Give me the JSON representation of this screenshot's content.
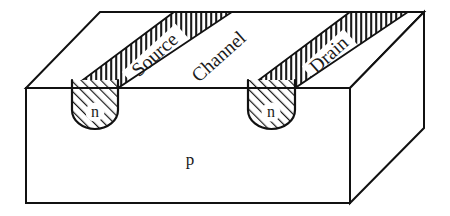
{
  "figure": {
    "background_color": "#ffffff",
    "line_color": "#111111",
    "hatch_color": "#1a1a1a",
    "width": 450,
    "height": 216
  },
  "labels": {
    "source": "Source",
    "channel": "Channel",
    "drain": "Drain",
    "n_left": "n",
    "n_right": "n",
    "substrate": "p"
  },
  "regions": [
    {
      "name": "source-stripe",
      "label": "Source",
      "fill": "hatched-vertical",
      "face": "top"
    },
    {
      "name": "channel-region",
      "label": "Channel",
      "fill": "none",
      "face": "top"
    },
    {
      "name": "drain-stripe",
      "label": "Drain",
      "fill": "hatched-vertical",
      "face": "top"
    },
    {
      "name": "n-well-left",
      "label": "n",
      "fill": "hatched-diagonal",
      "face": "front"
    },
    {
      "name": "n-well-right",
      "label": "n",
      "fill": "hatched-diagonal",
      "face": "front"
    },
    {
      "name": "substrate-body",
      "label": "p",
      "fill": "none",
      "face": "front"
    }
  ],
  "geometry": {
    "top_face": "100,12 424,12 350,88 26,88",
    "front_face": "26,88 350,88 350,203 26,203",
    "right_face": "350,88 424,12 424,128 350,203",
    "source_stripe": "174,12 232,12 118,88 72,88",
    "drain_stripe": "350,12 408,12 295,88 248,88",
    "n_well_left": {
      "x": 72,
      "y_top": 80,
      "width": 46,
      "y_bottom": 128
    },
    "n_well_right": {
      "x": 248,
      "y_top": 80,
      "width": 47,
      "y_bottom": 128
    }
  },
  "label_positions": {
    "source": {
      "x": 156,
      "y": 56,
      "rotate": -42
    },
    "channel": {
      "x": 220,
      "y": 58,
      "rotate": -42
    },
    "drain": {
      "x": 330,
      "y": 56,
      "rotate": -42
    },
    "n_left": {
      "x": 95,
      "y": 114
    },
    "n_right": {
      "x": 271,
      "y": 114
    },
    "substrate": {
      "x": 190,
      "y": 161
    }
  }
}
